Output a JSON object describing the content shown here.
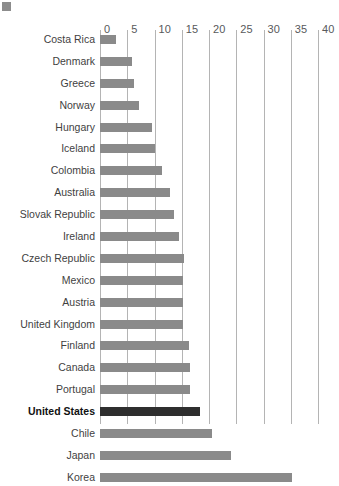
{
  "figure": {
    "corner_mark": "square-marker"
  },
  "chart_data": {
    "type": "bar",
    "orientation": "horizontal",
    "title": "",
    "subtitle": "",
    "xlabel": "",
    "ylabel": "",
    "xlim": [
      0,
      40
    ],
    "ylim": null,
    "grid": "vertical",
    "legend": "none",
    "tick_labels": [
      "0",
      "5",
      "10",
      "15",
      "20",
      "25",
      "30",
      "35",
      "40"
    ],
    "ticks": [
      0,
      5,
      10,
      15,
      20,
      25,
      30,
      35,
      40
    ],
    "highlighted_category": "United States",
    "bar_color": "#8a8a8a",
    "highlight_color": "#2e2e2e",
    "gridline_color": "#b4b4b4",
    "categories": [
      "Costa Rica",
      "Denmark",
      "Greece",
      "Norway",
      "Hungary",
      "Iceland",
      "Colombia",
      "Australia",
      "Slovak Republic",
      "Ireland",
      "Czech Republic",
      "Mexico",
      "Austria",
      "United Kingdom",
      "Finland",
      "Canada",
      "Portugal",
      "United States",
      "Chile",
      "Japan",
      "Korea"
    ],
    "values": [
      3.0,
      5.8,
      6.3,
      7.2,
      9.5,
      10.0,
      11.3,
      12.8,
      13.5,
      14.5,
      15.5,
      15.3,
      15.3,
      15.2,
      16.3,
      16.6,
      16.5,
      18.3,
      20.5,
      24.0,
      35.3
    ]
  }
}
